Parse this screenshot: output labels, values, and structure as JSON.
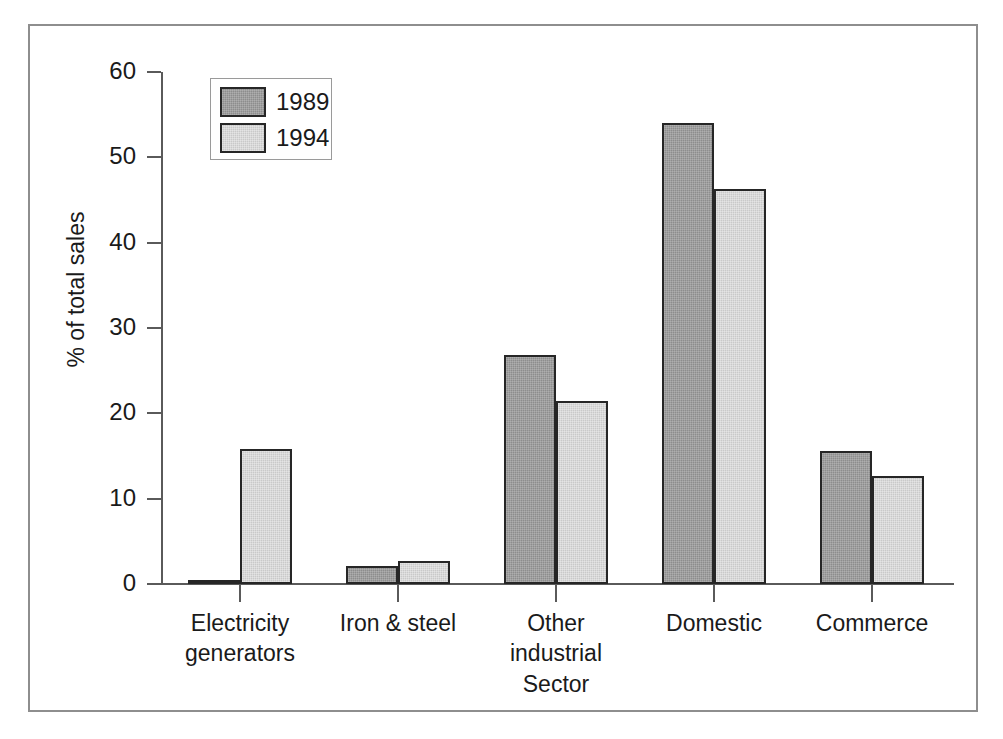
{
  "chart_data": {
    "type": "bar",
    "title": "",
    "xlabel": "Sector",
    "ylabel": "% of total sales",
    "categories": [
      "Electricity generators",
      "Iron & steel",
      "Other industrial",
      "Domestic",
      "Commerce"
    ],
    "category_lines": [
      [
        "Electricity",
        "generators"
      ],
      [
        "Iron & steel",
        ""
      ],
      [
        "Other",
        "industrial"
      ],
      [
        "Domestic",
        ""
      ],
      [
        "Commerce",
        ""
      ]
    ],
    "series": [
      {
        "name": "1989",
        "values": [
          0.5,
          2.1,
          26.8,
          54.0,
          15.6
        ]
      },
      {
        "name": "1994",
        "values": [
          15.8,
          2.7,
          21.4,
          46.3,
          12.7
        ]
      }
    ],
    "ylim": [
      0,
      60
    ],
    "yticks": [
      0,
      10,
      20,
      30,
      40,
      50,
      60
    ],
    "ytick_labels": [
      "0",
      "10",
      "20",
      "30",
      "40",
      "50",
      "60"
    ],
    "grid": false,
    "legend_position": "upper-left",
    "colors": {
      "series_1989": "#8d8d8d",
      "series_1994": "#c9c9c9",
      "bar_outline": "#262626",
      "axis": "#5a5a5a",
      "frame": "#8e8e8e",
      "text": "#1a1a1a",
      "background": "#ffffff"
    }
  },
  "legend": {
    "entries": [
      {
        "label": "1989"
      },
      {
        "label": "1994"
      }
    ]
  },
  "axes": {
    "y_title": "% of total sales",
    "x_title": "Sector"
  }
}
